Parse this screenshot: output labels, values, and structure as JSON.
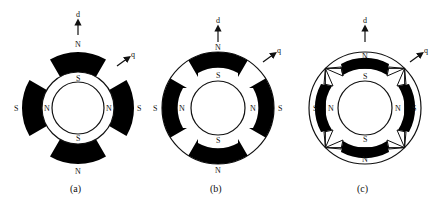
{
  "figures": [
    {
      "id": "a",
      "caption": "(a)",
      "axis_d": "d",
      "axis_q": "q",
      "outer_pole_labels": {
        "top": "N",
        "bottom": "N",
        "left": "S",
        "right": "S"
      },
      "inner_pole_labels": {
        "top": "S",
        "bottom": "S",
        "left": "N",
        "right": "N"
      }
    },
    {
      "id": "b",
      "caption": "(b)",
      "axis_d": "d",
      "axis_q": "q",
      "outer_pole_labels": {
        "top": "N",
        "bottom": "N",
        "left": "S",
        "right": "S"
      },
      "inner_pole_labels": {
        "top": "S",
        "bottom": "S",
        "left": "N",
        "right": "N"
      }
    },
    {
      "id": "c",
      "caption": "(c)",
      "axis_d": "d",
      "axis_q": "q",
      "outer_pole_labels": {
        "top": "N",
        "bottom": "N",
        "left": "S",
        "right": "S"
      },
      "inner_pole_labels": {
        "top": "S",
        "bottom": "S",
        "left": "N",
        "right": "N"
      }
    }
  ],
  "colors": {
    "magnet": "#000000",
    "line": "#111111",
    "background": "#ffffff"
  }
}
